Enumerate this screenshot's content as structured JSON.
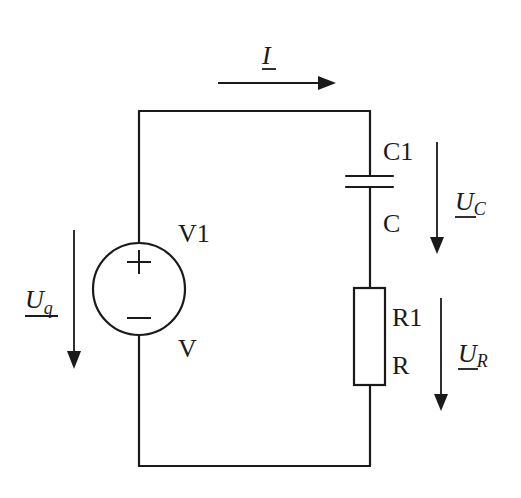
{
  "diagram": {
    "type": "circuit-schematic",
    "colors": {
      "ink": "#1a1a1a",
      "background": "#ffffff"
    },
    "current": {
      "symbol": "I",
      "underlined": true,
      "direction": "right"
    },
    "source": {
      "name": "V1",
      "value": "V",
      "kind": "voltage-source",
      "positive_sign": "+",
      "negative_sign": "−",
      "voltage": {
        "symbol": "U",
        "subscript": "q",
        "underlined": true,
        "direction": "down"
      }
    },
    "capacitor": {
      "name": "C1",
      "value": "C",
      "voltage": {
        "symbol": "U",
        "subscript": "C",
        "underlined": true,
        "direction": "down"
      }
    },
    "resistor": {
      "name": "R1",
      "value": "R",
      "voltage": {
        "symbol": "U",
        "subscript": "R",
        "underlined": true,
        "direction": "down"
      }
    }
  }
}
